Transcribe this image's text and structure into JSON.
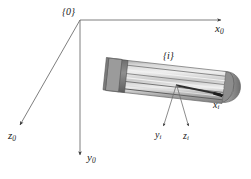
{
  "diagram": {
    "frames": [
      {
        "id": "frame-0",
        "label": "{0}",
        "x": 62,
        "y": 7
      },
      {
        "id": "frame-i",
        "label": "{i}",
        "x": 163,
        "y": 51
      }
    ],
    "axes": [
      {
        "id": "x0",
        "label": "x",
        "subscript": "0",
        "frame": "{0}",
        "from": [
          80,
          20
        ],
        "to": [
          222,
          20
        ],
        "direction": "right"
      },
      {
        "id": "y0",
        "label": "y",
        "subscript": "0",
        "frame": "{0}",
        "from": [
          80,
          20
        ],
        "to": [
          80,
          156
        ],
        "direction": "down"
      },
      {
        "id": "z0",
        "label": "z",
        "subscript": "0",
        "frame": "{0}",
        "from": [
          80,
          20
        ],
        "to": [
          19,
          126
        ],
        "direction": "down-left"
      },
      {
        "id": "xi",
        "label": "x",
        "subscript": "i",
        "frame": "{i}",
        "from": [
          176,
          84
        ],
        "to": [
          222,
          99
        ],
        "direction": "along-link-axis"
      },
      {
        "id": "yi",
        "label": "y",
        "subscript": "i",
        "frame": "{i}",
        "from": [
          176,
          84
        ],
        "to": [
          163,
          128
        ],
        "direction": "down-left"
      },
      {
        "id": "zi",
        "label": "z",
        "subscript": "i",
        "frame": "{i}",
        "from": [
          176,
          84
        ],
        "to": [
          188,
          128
        ],
        "direction": "down-right"
      }
    ],
    "link_body": {
      "name": "robot-link-cylinder",
      "description": "ribbed cylindrical link rendered in grayscale, tilted down to the right",
      "origin": [
        176,
        84
      ],
      "left_end": [
        108,
        62
      ],
      "right_end": [
        236,
        98
      ],
      "stripe_count": 7
    },
    "colors": {
      "background": "#ffffff",
      "line": "#6f6f6f",
      "text": "#1a1a1a",
      "body_light": "#e3e3e3",
      "body_mid": "#b9b9b9",
      "body_dark": "#8a8a8a",
      "body_darkest": "#6a6a6a",
      "cap": "#9a9a9a"
    }
  }
}
